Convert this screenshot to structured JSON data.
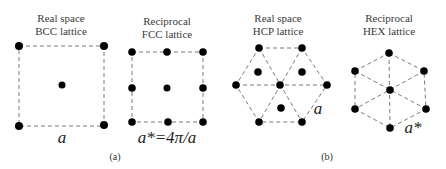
{
  "panel_a": {
    "caption": "(a)",
    "real": {
      "title_line1": "Real space",
      "title_line2": "BCC lattice",
      "lattice_label": "a"
    },
    "reciprocal": {
      "title_line1": "Reciprocal",
      "title_line2": "FCC lattice",
      "lattice_label": "a*=4π/a"
    }
  },
  "panel_b": {
    "caption": "(b)",
    "real": {
      "title_line1": "Real space",
      "title_line2": "HCP lattice",
      "lattice_label": "a"
    },
    "reciprocal": {
      "title_line1": "Reciprocal",
      "title_line2": "HEX lattice",
      "lattice_label": "a*"
    }
  },
  "colors": {
    "dot": "#000000",
    "dashed_line": "#7a7a7a",
    "text": "#333333"
  }
}
